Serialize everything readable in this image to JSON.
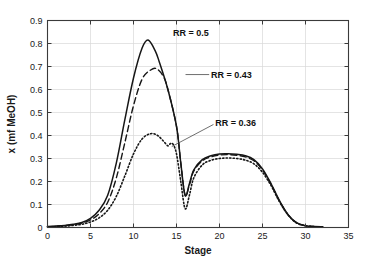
{
  "chart_data": {
    "type": "line",
    "title": "",
    "xlabel": "Stage",
    "ylabel": "x (mf MeOH)",
    "xlim": [
      0,
      35
    ],
    "ylim": [
      0,
      0.9
    ],
    "xticks": [
      0,
      5,
      10,
      15,
      20,
      25,
      30,
      35
    ],
    "xtick_labels": [
      "0",
      "5",
      "10",
      "15",
      "20",
      "25",
      "30",
      "35"
    ],
    "yticks": [
      0,
      0.1,
      0.2,
      0.3,
      0.4,
      0.5,
      0.6,
      0.7,
      0.8,
      0.9
    ],
    "ytick_labels": [
      "0",
      "0.1",
      "0.2",
      "0.3",
      "0.4",
      "0.5",
      "0.6",
      "0.7",
      "0.8",
      "0.9"
    ],
    "grid": true,
    "legend_position": "none",
    "series": [
      {
        "name": "RR = 0.5",
        "style": "solid",
        "color": "#161616",
        "x": [
          0,
          1,
          2,
          3,
          4,
          5,
          6,
          7,
          8,
          9,
          10,
          11,
          11.7,
          12.5,
          13,
          14,
          15,
          15.5,
          16,
          16.5,
          17,
          18,
          19,
          20,
          21,
          22,
          23,
          24,
          25,
          26,
          27,
          28,
          29,
          30,
          31,
          32
        ],
        "y": [
          0.004,
          0.006,
          0.009,
          0.014,
          0.022,
          0.04,
          0.075,
          0.14,
          0.28,
          0.47,
          0.65,
          0.78,
          0.815,
          0.77,
          0.72,
          0.6,
          0.44,
          0.28,
          0.14,
          0.19,
          0.25,
          0.295,
          0.312,
          0.32,
          0.321,
          0.318,
          0.312,
          0.295,
          0.255,
          0.19,
          0.115,
          0.055,
          0.02,
          0.008,
          0.004,
          0.003
        ]
      },
      {
        "name": "RR = 0.43",
        "style": "dashed",
        "color": "#161616",
        "x": [
          0,
          1,
          2,
          3,
          4,
          5,
          6,
          7,
          8,
          9,
          10,
          11,
          12,
          12.7,
          13.5,
          14,
          15,
          15.5,
          16,
          16.5,
          17,
          18,
          19,
          20,
          21,
          22,
          23,
          24,
          25,
          26,
          27,
          28,
          29,
          30,
          31,
          32
        ],
        "y": [
          0.003,
          0.005,
          0.008,
          0.012,
          0.019,
          0.033,
          0.06,
          0.11,
          0.215,
          0.37,
          0.53,
          0.645,
          0.685,
          0.69,
          0.655,
          0.6,
          0.44,
          0.28,
          0.14,
          0.185,
          0.245,
          0.29,
          0.307,
          0.315,
          0.317,
          0.314,
          0.307,
          0.29,
          0.25,
          0.187,
          0.113,
          0.054,
          0.019,
          0.008,
          0.004,
          0.003
        ]
      },
      {
        "name": "RR = 0.36",
        "style": "dotted",
        "color": "#161616",
        "x": [
          0,
          1,
          2,
          3,
          4,
          5,
          6,
          7,
          8,
          9,
          10,
          11,
          12,
          12.8,
          13.5,
          14,
          14.3,
          14.6,
          15,
          15.5,
          16,
          16.5,
          17,
          18,
          19,
          20,
          21,
          22,
          23,
          24,
          25,
          26,
          27,
          28,
          29,
          30,
          31,
          32
        ],
        "y": [
          0.002,
          0.004,
          0.006,
          0.009,
          0.014,
          0.024,
          0.042,
          0.075,
          0.135,
          0.225,
          0.32,
          0.385,
          0.408,
          0.4,
          0.375,
          0.355,
          0.365,
          0.362,
          0.32,
          0.2,
          0.082,
          0.14,
          0.215,
          0.272,
          0.292,
          0.3,
          0.302,
          0.3,
          0.293,
          0.277,
          0.24,
          0.182,
          0.11,
          0.053,
          0.019,
          0.008,
          0.004,
          0.003
        ]
      }
    ],
    "annotations": [
      {
        "text": "RR = 0.5",
        "x": 14.6,
        "y": 0.845,
        "anchor": "start",
        "leader": false
      },
      {
        "text": "RR = 0.43",
        "x": 19.0,
        "y": 0.665,
        "anchor": "start",
        "leader": true,
        "leader_from": [
          18.8,
          0.665
        ],
        "leader_to": [
          16.05,
          0.665
        ]
      },
      {
        "text": "RR = 0.36",
        "x": 19.5,
        "y": 0.455,
        "anchor": "start",
        "leader": true,
        "leader_from": [
          19.3,
          0.448
        ],
        "leader_to": [
          14.45,
          0.352
        ]
      }
    ]
  }
}
